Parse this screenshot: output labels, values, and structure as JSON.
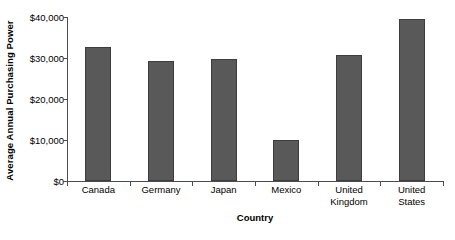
{
  "chart_data": {
    "type": "bar",
    "title": "",
    "xlabel": "Country",
    "ylabel": "Average Annual Purchasing Power",
    "categories": [
      "Canada",
      "Germany",
      "Japan",
      "Mexico",
      "United Kingdom",
      "United States"
    ],
    "category_lines": [
      [
        "Canada"
      ],
      [
        "Germany"
      ],
      [
        "Japan"
      ],
      [
        "Mexico"
      ],
      [
        "United",
        "Kingdom"
      ],
      [
        "United",
        "States"
      ]
    ],
    "values": [
      32700,
      29300,
      29800,
      10000,
      30700,
      39500
    ],
    "ylim": [
      0,
      40000
    ],
    "y_ticks": [
      0,
      10000,
      20000,
      30000,
      40000
    ],
    "y_tick_labels": [
      "$0",
      "$10,000",
      "$20,000",
      "$30,000",
      "$40,000"
    ],
    "grid": false,
    "legend": "none",
    "bar_color": "#595959",
    "bar_border_color": "#3d3d3d",
    "axis_color": "#4d4d4d",
    "background_color": "#ffffff"
  }
}
